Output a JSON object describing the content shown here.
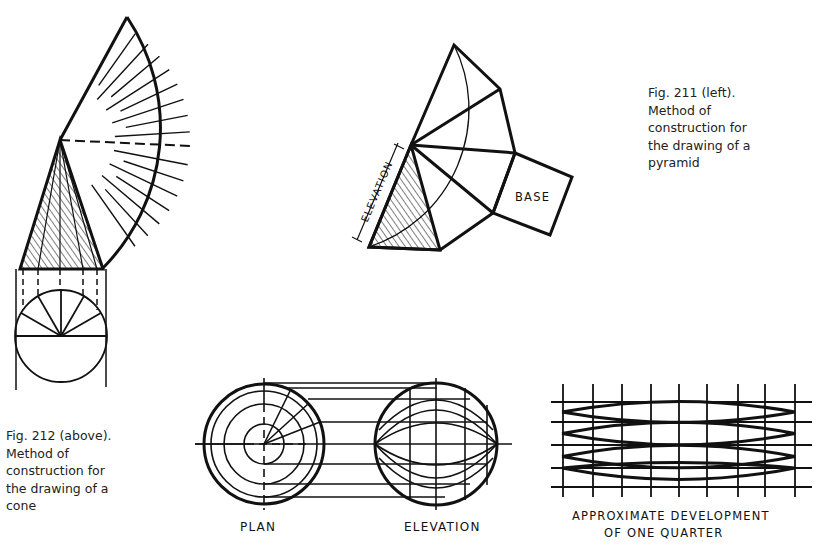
{
  "figures": {
    "fig211": {
      "caption_lines": [
        "Fig. 211 (left).",
        "Method of",
        "construction for",
        "the drawing of a",
        "pyramid"
      ],
      "labels": {
        "elevation": "ELEVATION",
        "base": "BASE"
      }
    },
    "fig212": {
      "caption_lines": [
        "Fig. 212 (above).",
        "Method of",
        "construction for",
        "the drawing of a",
        "cone"
      ]
    },
    "sphere": {
      "labels": {
        "plan": "PLAN",
        "elevation": "ELEVATION",
        "development_line1": "APPROXIMATE DEVELOPMENT",
        "development_line2": "OF ONE QUARTER"
      }
    }
  },
  "colors": {
    "ink": "#111111",
    "paper": "#ffffff",
    "caption": "#222222"
  }
}
